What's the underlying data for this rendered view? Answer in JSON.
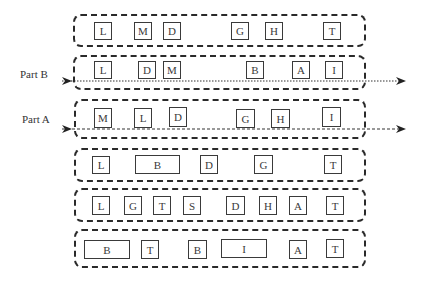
{
  "labels": {
    "part_b": "Part B",
    "part_a": "Part A"
  },
  "rows": [
    {
      "cells": [
        {
          "t": "L"
        },
        {
          "t": "M"
        },
        {
          "t": "D"
        },
        {
          "t": "G"
        },
        {
          "t": "H"
        },
        {
          "t": "T"
        }
      ]
    },
    {
      "cells": [
        {
          "t": "L"
        },
        {
          "t": "D"
        },
        {
          "t": "M"
        },
        {
          "t": "B"
        },
        {
          "t": "A"
        },
        {
          "t": "I"
        }
      ]
    },
    {
      "cells": [
        {
          "t": "M"
        },
        {
          "t": "L"
        },
        {
          "t": "D"
        },
        {
          "t": "G"
        },
        {
          "t": "H"
        },
        {
          "t": "I"
        }
      ]
    },
    {
      "cells": [
        {
          "t": "L"
        },
        {
          "t": "B"
        },
        {
          "t": "D"
        },
        {
          "t": "G"
        },
        {
          "t": "T"
        }
      ]
    },
    {
      "cells": [
        {
          "t": "L"
        },
        {
          "t": "G"
        },
        {
          "t": "T"
        },
        {
          "t": "S"
        },
        {
          "t": "D"
        },
        {
          "t": "H"
        },
        {
          "t": "A"
        },
        {
          "t": "T"
        }
      ]
    },
    {
      "cells": [
        {
          "t": "B"
        },
        {
          "t": "T"
        },
        {
          "t": "B"
        },
        {
          "t": "I"
        },
        {
          "t": "A"
        },
        {
          "t": "T"
        }
      ]
    }
  ],
  "arrows": [
    {
      "name": "part-b-arrow",
      "style": "dotted"
    },
    {
      "name": "part-a-arrow",
      "style": "dashed"
    }
  ]
}
